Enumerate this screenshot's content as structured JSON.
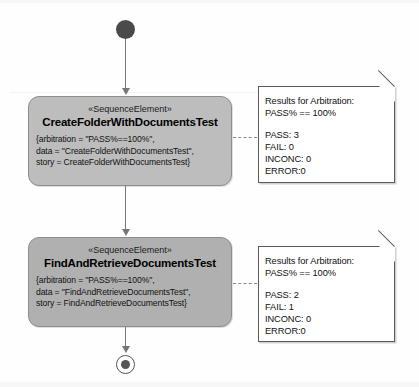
{
  "diagram": {
    "type": "uml-activity-diagram",
    "background_color": "#ffffff",
    "node_fill_color": "#bdbdbd",
    "note_fill_color": "#ffffff",
    "edge_color": "#777777"
  },
  "initial_node": {
    "label": "initial-node"
  },
  "final_node": {
    "label": "final-activity-final-node"
  },
  "activities": [
    {
      "stereotype": "«SequenceElement»",
      "name": "CreateFolderWithDocumentsTest",
      "properties": [
        "{arbitration = \"PASS%==100%\",",
        "data = \"CreateFolderWithDocumentsTest\",",
        "story = CreateFolderWithDocumentsTest}"
      ]
    },
    {
      "stereotype": "«SequenceElement»",
      "name": "FindAndRetrieveDocumentsTest",
      "properties": [
        "{arbitration = \"PASS%==100%\",",
        "data = \"FindAndRetrieveDocumentsTest\",",
        "story = FindAndRetrieveDocumentsTest}"
      ]
    }
  ],
  "notes": [
    {
      "header": "Results for Arbitration:",
      "criterion": "PASS% == 100%",
      "results": [
        "PASS: 3",
        "FAIL: 0",
        "INCONC: 0",
        "ERROR:0"
      ]
    },
    {
      "header": "Results for Arbitration:",
      "criterion": "PASS% == 100%",
      "results": [
        "PASS: 2",
        "FAIL: 1",
        "INCONC: 0",
        "ERROR:0"
      ]
    }
  ]
}
